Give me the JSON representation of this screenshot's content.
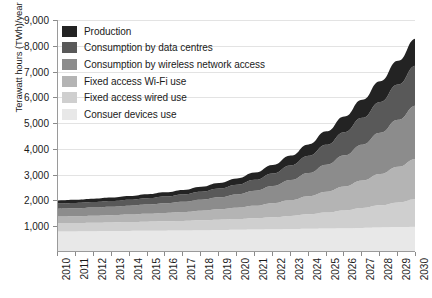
{
  "chart_data": {
    "type": "area",
    "stacked": true,
    "title": "",
    "xlabel": "",
    "ylabel": "Terawatt hours (TWh)/year",
    "x": [
      2010,
      2011,
      2012,
      2013,
      2014,
      2015,
      2016,
      2017,
      2018,
      2019,
      2020,
      2021,
      2022,
      2023,
      2024,
      2025,
      2026,
      2027,
      2028,
      2029,
      2030
    ],
    "xlim": [
      2010,
      2030
    ],
    "ylim": [
      0,
      9000
    ],
    "yticks": [
      1000,
      2000,
      3000,
      4000,
      5000,
      6000,
      7000,
      8000,
      9000
    ],
    "ytick_labels": [
      "1,000",
      "2,000",
      "3,000",
      "4,000",
      "5,000",
      "6,000",
      "7,000",
      "8,000",
      "9,000"
    ],
    "xtick_labels": [
      "2010",
      "2011",
      "2012",
      "2013",
      "2014",
      "2015",
      "2016",
      "2017",
      "2018",
      "2019",
      "2020",
      "2021",
      "2022",
      "2023",
      "2024",
      "2025",
      "2026",
      "2027",
      "2028",
      "2029",
      "2030"
    ],
    "grid": true,
    "legend_position": "top-left",
    "series": [
      {
        "name": "Consuer devices use",
        "color": "#e8e8e8",
        "values": [
          800,
          800,
          805,
          810,
          815,
          820,
          825,
          830,
          840,
          850,
          860,
          870,
          880,
          890,
          900,
          910,
          920,
          935,
          950,
          965,
          980
        ]
      },
      {
        "name": "Fixed access wired use",
        "color": "#cfcfcf",
        "values": [
          320,
          325,
          330,
          335,
          345,
          355,
          365,
          375,
          390,
          405,
          420,
          440,
          470,
          510,
          560,
          620,
          690,
          770,
          860,
          960,
          1070
        ]
      },
      {
        "name": "Fixed access Wi-Fi use",
        "color": "#b4b4b4",
        "values": [
          260,
          265,
          275,
          285,
          295,
          310,
          325,
          345,
          370,
          400,
          435,
          480,
          540,
          615,
          705,
          810,
          930,
          1065,
          1215,
          1380,
          1560
        ]
      },
      {
        "name": "Consumption by wireless network access",
        "color": "#8c8c8c",
        "values": [
          300,
          305,
          315,
          325,
          340,
          355,
          375,
          400,
          430,
          470,
          520,
          585,
          670,
          775,
          900,
          1045,
          1210,
          1395,
          1600,
          1825,
          2070
        ]
      },
      {
        "name": "Consumption by data centres",
        "color": "#595959",
        "values": [
          200,
          205,
          210,
          220,
          230,
          245,
          260,
          280,
          305,
          335,
          375,
          425,
          490,
          570,
          665,
          775,
          900,
          1040,
          1195,
          1365,
          1550
        ]
      },
      {
        "name": "Production",
        "color": "#232323",
        "values": [
          120,
          125,
          130,
          135,
          145,
          155,
          165,
          180,
          200,
          220,
          245,
          280,
          325,
          380,
          445,
          520,
          605,
          700,
          805,
          920,
          1045
        ]
      }
    ],
    "totals": [
      2000,
      2025,
      2065,
      2110,
      2170,
      2240,
      2315,
      2410,
      2535,
      2680,
      2855,
      3080,
      3375,
      3740,
      4175,
      4680,
      5255,
      5905,
      6625,
      7415,
      8275
    ]
  },
  "legend": {
    "items": [
      {
        "label": "Production",
        "color": "#232323"
      },
      {
        "label": "Consumption by data centres",
        "color": "#595959"
      },
      {
        "label": "Consumption by wireless network access",
        "color": "#8c8c8c"
      },
      {
        "label": "Fixed access Wi-Fi use",
        "color": "#b4b4b4"
      },
      {
        "label": "Fixed access wired use",
        "color": "#cfcfcf"
      },
      {
        "label": "Consuer devices use",
        "color": "#e8e8e8"
      }
    ]
  }
}
